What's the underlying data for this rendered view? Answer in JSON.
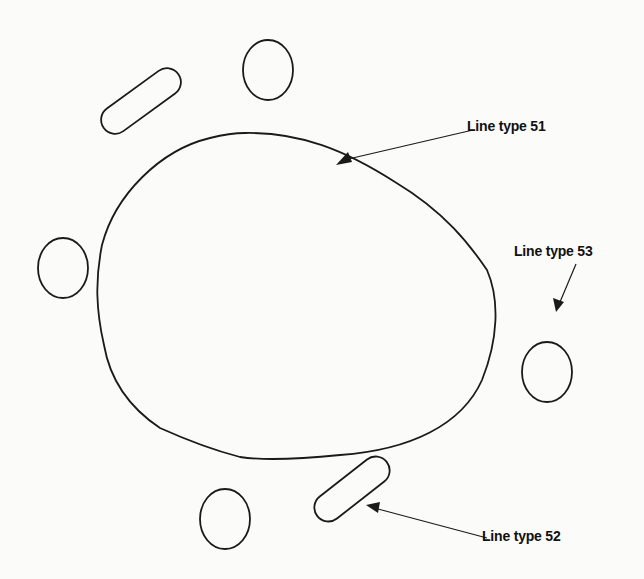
{
  "figure": {
    "background": "#fbfbfa",
    "stroke_color": "#1a1a1a",
    "labels": [
      {
        "id": "51",
        "text": "Line type 51",
        "x": 467,
        "y": 118,
        "target": "large-blob"
      },
      {
        "id": "53",
        "text": "Line type 53",
        "x": 514,
        "y": 243,
        "target": "circle-right"
      },
      {
        "id": "52",
        "text": "Line type 52",
        "x": 482,
        "y": 528,
        "target": "pill-bottom-right"
      }
    ],
    "shapes": [
      {
        "id": "large-blob",
        "type": "closed-curve",
        "line_type": "51"
      },
      {
        "id": "circle-top",
        "type": "circle"
      },
      {
        "id": "circle-left",
        "type": "circle"
      },
      {
        "id": "circle-right",
        "type": "circle",
        "line_type": "53"
      },
      {
        "id": "circle-bottom",
        "type": "circle"
      },
      {
        "id": "pill-top-left",
        "type": "slot"
      },
      {
        "id": "pill-bottom-right",
        "type": "slot",
        "line_type": "52"
      }
    ]
  }
}
